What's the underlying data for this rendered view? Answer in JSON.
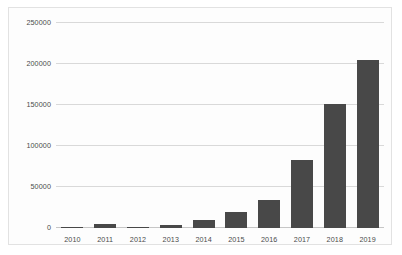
{
  "chart_data": {
    "type": "bar",
    "title": "",
    "subtitle": "",
    "xlabel": "",
    "ylabel": "",
    "categories": [
      "2010",
      "2011",
      "2012",
      "2013",
      "2014",
      "2015",
      "2016",
      "2017",
      "2018",
      "2019"
    ],
    "values": [
      1000,
      4500,
      1500,
      4000,
      10000,
      20000,
      34000,
      83000,
      151000,
      205000
    ],
    "series": [
      {
        "name": "",
        "values": [
          1000,
          4500,
          1500,
          4000,
          10000,
          20000,
          34000,
          83000,
          151000,
          205000
        ]
      }
    ],
    "ylim": [
      0,
      250000
    ],
    "yticks": [
      0,
      50000,
      100000,
      150000,
      200000,
      250000
    ],
    "ytick_labels": [
      "0",
      "50000",
      "100000",
      "150000",
      "200000",
      "250000"
    ],
    "xtick_labels": [
      "2010",
      "2011",
      "2012",
      "2013",
      "2014",
      "2015",
      "2016",
      "2017",
      "2018",
      "2019"
    ],
    "grid": "horizontal",
    "legend": "none",
    "annotations": [],
    "colors": {
      "bar": "#484848",
      "gridline": "#d9d9d9",
      "axis": "#c6c6c6",
      "tick_text": "#4a4a4a",
      "plot_background": "#fdfdfd",
      "frame_border": "#e2e2e2",
      "page_background": "#ffffff"
    }
  }
}
